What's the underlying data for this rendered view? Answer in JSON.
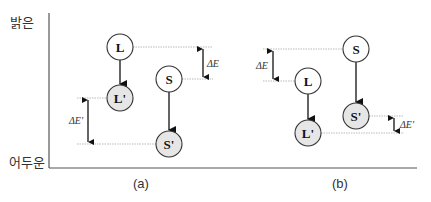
{
  "axis": {
    "top_label": "밝은",
    "bottom_label": "어두운"
  },
  "colors": {
    "axis": "#555555",
    "node_stroke": "#333333",
    "node_fill_initial": "#ffffff",
    "node_fill_final": "#e6e6e6",
    "guide_line": "#aaaaaa",
    "arrow": "#111111"
  },
  "panels": [
    {
      "id": "a",
      "caption": "(a)",
      "nodes": [
        {
          "id": "L",
          "label": "L",
          "cx": 120,
          "cy": 47,
          "state": "initial"
        },
        {
          "id": "L_prime",
          "label": "L'",
          "cx": 120,
          "cy": 98,
          "state": "final"
        },
        {
          "id": "S",
          "label": "S",
          "cx": 169,
          "cy": 79,
          "state": "initial"
        },
        {
          "id": "S_prime",
          "label": "S'",
          "cx": 169,
          "cy": 144,
          "state": "final"
        }
      ],
      "delta_before": {
        "label": "ΔE",
        "y_top": 47,
        "y_bottom": 79
      },
      "delta_after": {
        "label": "ΔE'",
        "y_top": 98,
        "y_bottom": 144
      }
    },
    {
      "id": "b",
      "caption": "(b)",
      "nodes": [
        {
          "id": "S",
          "label": "S",
          "cx": 356,
          "cy": 49,
          "state": "initial"
        },
        {
          "id": "L",
          "label": "L",
          "cx": 308,
          "cy": 81,
          "state": "initial"
        },
        {
          "id": "S_prime",
          "label": "S'",
          "cx": 356,
          "cy": 116,
          "state": "final"
        },
        {
          "id": "L_prime",
          "label": "L'",
          "cx": 308,
          "cy": 133,
          "state": "final"
        }
      ],
      "delta_before": {
        "label": "ΔE",
        "y_top": 49,
        "y_bottom": 81
      },
      "delta_after": {
        "label": "ΔE'",
        "y_top": 116,
        "y_bottom": 133
      }
    }
  ]
}
